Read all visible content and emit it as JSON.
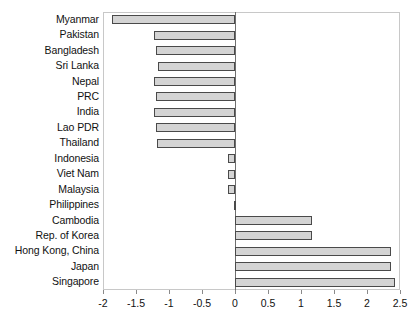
{
  "chart_data": {
    "type": "bar",
    "orientation": "horizontal",
    "title": "",
    "subtitle": "",
    "xlabel": "",
    "ylabel": "",
    "xlim": [
      -2,
      2.5
    ],
    "xticks": [
      -2,
      -1.5,
      -1,
      -0.5,
      0,
      0.5,
      1,
      1.5,
      2,
      2.5
    ],
    "xtick_labels": [
      "-2",
      "-1.5",
      "-1",
      "-0.5",
      "0",
      "0.5",
      "1",
      "1.5",
      "2",
      "2.5"
    ],
    "grid": false,
    "legend": null,
    "categories": [
      "Myanmar",
      "Pakistan",
      "Bangladesh",
      "Sri Lanka",
      "Nepal",
      "PRC",
      "India",
      "Lao PDR",
      "Thailand",
      "Indonesia",
      "Viet Nam",
      "Malaysia",
      "Philippines",
      "Cambodia",
      "Rep. of Korea",
      "Hong Kong, China",
      "Japan",
      "Singapore"
    ],
    "values": [
      -1.87,
      -1.22,
      -1.2,
      -1.17,
      -1.22,
      -1.2,
      -1.22,
      -1.2,
      -1.18,
      -0.11,
      -0.1,
      -0.11,
      -0.02,
      1.16,
      1.17,
      2.36,
      2.36,
      2.42
    ],
    "bar_fill_color": "#d4d4d4",
    "bar_border_color": "#4a4a4a",
    "axis_color": "#8a8a8a",
    "frame_color": "#c8c8c8",
    "background_color": "#ffffff"
  }
}
